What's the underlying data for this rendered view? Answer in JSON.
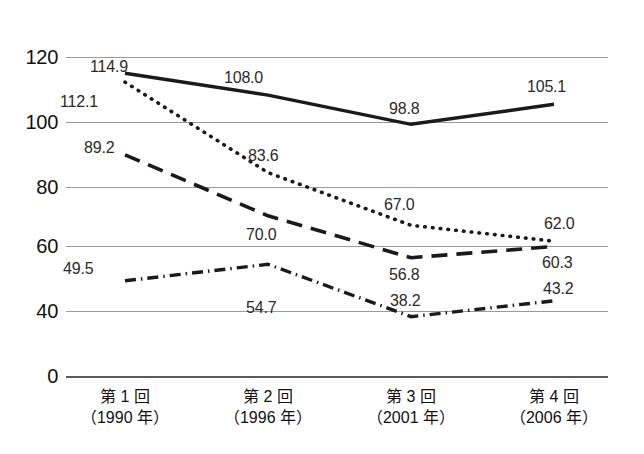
{
  "chart_data": {
    "type": "line",
    "title": "",
    "subtitle": "",
    "xlabel": "",
    "ylabel": "",
    "grid": true,
    "legend_position": "none",
    "ylim": [
      40,
      120
    ],
    "y_axis_break": true,
    "y_ticks": [
      "120",
      "100",
      "80",
      "60",
      "40",
      "0"
    ],
    "y_tick_values": [
      120,
      100,
      80,
      60,
      40,
      0
    ],
    "categories": [
      "第 1 回",
      "第 2 回",
      "第 3 回",
      "第 4 回"
    ],
    "category_sublabels": [
      "（1990 年）",
      "（1996 年）",
      "（2001 年）",
      "（2006 年）"
    ],
    "series": [
      {
        "name": "series-solid",
        "style": "solid",
        "color": "#1a1a1a",
        "values": [
          114.9,
          108.0,
          98.8,
          105.1
        ],
        "labels": [
          "114.9",
          "108.0",
          "98.8",
          "105.1"
        ]
      },
      {
        "name": "series-dotted",
        "style": "dotted",
        "color": "#1a1a1a",
        "values": [
          112.1,
          83.6,
          67.0,
          62.0
        ],
        "labels": [
          "112.1",
          "83.6",
          "67.0",
          "62.0"
        ]
      },
      {
        "name": "series-dashed",
        "style": "dashed",
        "color": "#1a1a1a",
        "values": [
          89.2,
          70.0,
          56.8,
          60.3
        ],
        "labels": [
          "89.2",
          "70.0",
          "56.8",
          "60.3"
        ]
      },
      {
        "name": "series-dash-dot",
        "style": "dash-dot",
        "color": "#1a1a1a",
        "values": [
          49.5,
          54.7,
          38.2,
          43.2
        ],
        "labels": [
          "49.5",
          "54.7",
          "38.2",
          "43.2"
        ]
      }
    ]
  },
  "axis": {
    "y_tick_0": "120",
    "y_tick_1": "100",
    "y_tick_2": "80",
    "y_tick_3": "60",
    "y_tick_4": "40",
    "y_tick_5": "0"
  },
  "xaxis": {
    "cat0_main": "第 1 回",
    "cat0_sub": "（1990 年）",
    "cat1_main": "第 2 回",
    "cat1_sub": "（1996 年）",
    "cat2_main": "第 3 回",
    "cat2_sub": "（2001 年）",
    "cat3_main": "第 4 回",
    "cat3_sub": "（2006 年）"
  },
  "labels": {
    "s1p1": "114.9",
    "s1p2": "108.0",
    "s1p3": "98.8",
    "s1p4": "105.1",
    "s2p1": "112.1",
    "s2p2": "83.6",
    "s2p3": "67.0",
    "s2p4": "62.0",
    "s3p1": "89.2",
    "s3p2": "70.0",
    "s3p3": "56.8",
    "s3p4": "60.3",
    "s4p1": "49.5",
    "s4p2": "54.7",
    "s4p3": "38.2",
    "s4p4": "43.2"
  },
  "colors": {
    "line": "#1a1a1a",
    "grid": "#9a9a9a",
    "text": "#111111"
  }
}
